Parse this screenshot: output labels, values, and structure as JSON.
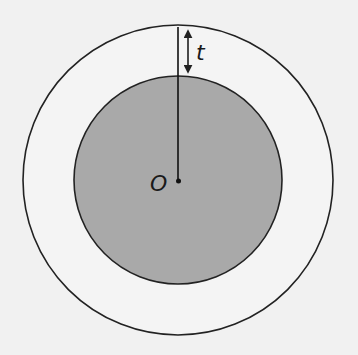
{
  "diagram": {
    "type": "concentric-circles",
    "background_color": "#f1f1f1",
    "outer_circle": {
      "cx": 178,
      "cy": 180,
      "r": 155,
      "fill": "#f4f4f4",
      "stroke": "#222222"
    },
    "inner_circle": {
      "cx": 178,
      "cy": 180,
      "r": 104,
      "fill": "#a9a9a9",
      "stroke": "#222222"
    },
    "center_point": {
      "label": "O"
    },
    "thickness_label": "t",
    "radius_line": "from outer circle top to center O",
    "arrow": "double-headed, spanning gap between outer and inner circle"
  }
}
